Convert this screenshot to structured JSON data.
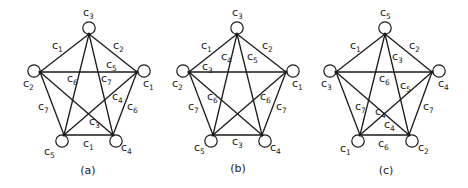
{
  "figure": {
    "panels": [
      {
        "caption": "(a)",
        "caption_pos": [
          88,
          174
        ],
        "vertices": {
          "T": {
            "junction": [
              89,
              34
            ],
            "circle": [
              89,
              28
            ],
            "label": "c",
            "sub": "3",
            "label_pos": [
              83,
              16
            ]
          },
          "L": {
            "junction": [
              40,
              72
            ],
            "circle": [
              34,
              71
            ],
            "label": "c",
            "sub": "2",
            "label_pos": [
              23,
              87
            ]
          },
          "R": {
            "junction": [
              137,
              72
            ],
            "circle": [
              144,
              71
            ],
            "label": "c",
            "sub": "1",
            "label_pos": [
              143,
              87
            ]
          },
          "BL": {
            "junction": [
              64,
              135
            ],
            "circle": [
              62,
              141
            ],
            "label": "c",
            "sub": "5",
            "label_pos": [
              44,
              155
            ]
          },
          "BR": {
            "junction": [
              113,
              135
            ],
            "circle": [
              116,
              141
            ],
            "label": "c",
            "sub": "4",
            "label_pos": [
              121,
              151
            ]
          }
        },
        "edges": [
          {
            "from": "T",
            "to": "L",
            "label": "c",
            "sub": "1",
            "label_pos": [
              52,
              49
            ]
          },
          {
            "from": "T",
            "to": "R",
            "label": "c",
            "sub": "2",
            "label_pos": [
              113,
              49
            ]
          },
          {
            "from": "L",
            "to": "R",
            "label": "c",
            "sub": "5",
            "label_pos": [
              106,
              68
            ]
          },
          {
            "from": "T",
            "to": "BL",
            "label": "c",
            "sub": "6",
            "label_pos": [
              67,
              82
            ]
          },
          {
            "from": "T",
            "to": "BR",
            "label": "c",
            "sub": "7",
            "label_pos": [
              101,
              82
            ]
          },
          {
            "from": "L",
            "to": "BL",
            "label": "c",
            "sub": "7",
            "label_pos": [
              38,
              110
            ]
          },
          {
            "from": "R",
            "to": "BR",
            "label": "c",
            "sub": "6",
            "label_pos": [
              127,
              110
            ]
          },
          {
            "from": "L",
            "to": "BR",
            "label": "c",
            "sub": "3",
            "label_pos": [
              89,
              125
            ]
          },
          {
            "from": "R",
            "to": "BL",
            "label": "c",
            "sub": "4",
            "label_pos": [
              112,
              100
            ]
          },
          {
            "from": "BL",
            "to": "BR",
            "label": "c",
            "sub": "1",
            "label_pos": [
              83,
              147
            ]
          }
        ]
      },
      {
        "caption": "(b)",
        "caption_pos": [
          238,
          172
        ],
        "vertices": {
          "T": {
            "junction": [
              237,
              34
            ],
            "circle": [
              237,
              28
            ],
            "label": "c",
            "sub": "3",
            "label_pos": [
              232,
              16
            ]
          },
          "L": {
            "junction": [
              189,
              72
            ],
            "circle": [
              183,
              71
            ],
            "label": "c",
            "sub": "2",
            "label_pos": [
              172,
              87
            ]
          },
          "R": {
            "junction": [
              286,
              72
            ],
            "circle": [
              293,
              71
            ],
            "label": "c",
            "sub": "1",
            "label_pos": [
              292,
              87
            ]
          },
          "BL": {
            "junction": [
              213,
              135
            ],
            "circle": [
              211,
              141
            ],
            "label": "c",
            "sub": "5",
            "label_pos": [
              194,
              151
            ]
          },
          "BR": {
            "junction": [
              262,
              135
            ],
            "circle": [
              265,
              141
            ],
            "label": "c",
            "sub": "4",
            "label_pos": [
              270,
              151
            ]
          }
        },
        "edges": [
          {
            "from": "T",
            "to": "L",
            "label": "c",
            "sub": "1",
            "label_pos": [
              201,
              49
            ]
          },
          {
            "from": "T",
            "to": "R",
            "label": "c",
            "sub": "2",
            "label_pos": [
              262,
              49
            ]
          },
          {
            "from": "L",
            "to": "R",
            "label": "c",
            "sub": "3",
            "label_pos": [
              202,
              70
            ]
          },
          {
            "from": "T",
            "to": "BL",
            "label": "c",
            "sub": "4",
            "label_pos": [
              221,
              60
            ]
          },
          {
            "from": "T",
            "to": "BR",
            "label": "c",
            "sub": "5",
            "label_pos": [
              247,
              60
            ]
          },
          {
            "from": "L",
            "to": "BL",
            "label": "c",
            "sub": "7",
            "label_pos": [
              188,
              110
            ]
          },
          {
            "from": "R",
            "to": "BR",
            "label": "c",
            "sub": "7",
            "label_pos": [
              276,
              110
            ]
          },
          {
            "from": "L",
            "to": "BR",
            "label": "c",
            "sub": "6",
            "label_pos": [
              207,
              100
            ]
          },
          {
            "from": "R",
            "to": "BL",
            "label": "c",
            "sub": "6",
            "label_pos": [
              260,
              100
            ]
          },
          {
            "from": "BL",
            "to": "BR",
            "label": "c",
            "sub": "3",
            "label_pos": [
              232,
              145
            ]
          }
        ]
      },
      {
        "caption": "(c)",
        "caption_pos": [
          386,
          174
        ],
        "vertices": {
          "T": {
            "junction": [
              385,
              34
            ],
            "circle": [
              385,
              28
            ],
            "label": "c",
            "sub": "5",
            "label_pos": [
              380,
              16
            ]
          },
          "L": {
            "junction": [
              336,
              72
            ],
            "circle": [
              330,
              71
            ],
            "label": "c",
            "sub": "3",
            "label_pos": [
              321,
              87
            ]
          },
          "R": {
            "junction": [
              432,
              72
            ],
            "circle": [
              439,
              71
            ],
            "label": "c",
            "sub": "4",
            "label_pos": [
              438,
              87
            ]
          },
          "BL": {
            "junction": [
              360,
              135
            ],
            "circle": [
              358,
              141
            ],
            "label": "c",
            "sub": "1",
            "label_pos": [
              340,
              152
            ]
          },
          "BR": {
            "junction": [
              409,
              135
            ],
            "circle": [
              412,
              141
            ],
            "label": "c",
            "sub": "2",
            "label_pos": [
              418,
              151
            ]
          }
        },
        "edges": [
          {
            "from": "T",
            "to": "L",
            "label": "c",
            "sub": "1",
            "label_pos": [
              350,
              49
            ]
          },
          {
            "from": "T",
            "to": "R",
            "label": "c",
            "sub": "2",
            "label_pos": [
              409,
              49
            ]
          },
          {
            "from": "L",
            "to": "R",
            "label": "c",
            "sub": "6",
            "label_pos": [
              379,
              82
            ]
          },
          {
            "from": "T",
            "to": "BL",
            "label": "c",
            "sub": "4",
            "label_pos": [
              375,
              115
            ]
          },
          {
            "from": "T",
            "to": "BR",
            "label": "c",
            "sub": "3",
            "label_pos": [
              392,
              60
            ]
          },
          {
            "from": "L",
            "to": "BL",
            "label": "c",
            "sub": "7",
            "label_pos": [
              355,
              110
            ]
          },
          {
            "from": "R",
            "to": "BR",
            "label": "c",
            "sub": "7",
            "label_pos": [
              423,
              110
            ]
          },
          {
            "from": "L",
            "to": "BR",
            "label": "c",
            "sub": "4",
            "label_pos": [
              384,
              128
            ]
          },
          {
            "from": "R",
            "to": "BL",
            "label": "c",
            "sub": "5",
            "label_pos": [
              400,
              89
            ]
          },
          {
            "from": "BL",
            "to": "BR",
            "label": "c",
            "sub": "6",
            "label_pos": [
              378,
              147
            ]
          }
        ]
      }
    ]
  }
}
